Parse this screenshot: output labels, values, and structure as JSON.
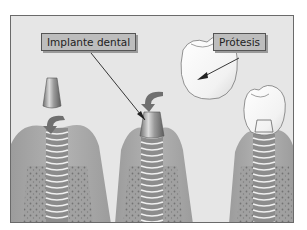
{
  "diagram": {
    "labels": {
      "implant": "Implante dental",
      "prosthesis": "Prótesis"
    },
    "stages": [
      {
        "name": "abutment-over-implant"
      },
      {
        "name": "abutment-placed-on-implant"
      },
      {
        "name": "crown-placed"
      }
    ],
    "colors": {
      "background": "#e6e6e6",
      "gum": "#a9a9a9",
      "bone_texture": "#7a7a7a",
      "implant_threads": "#f2f2f2",
      "tooth": "#f7f7f7",
      "label_fill": "#bdbdbd",
      "arrow": "#6f6f6f"
    }
  }
}
